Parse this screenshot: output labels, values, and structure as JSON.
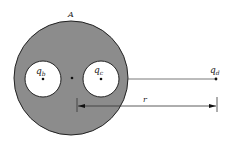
{
  "diagram": {
    "labels": {
      "sphere": "A",
      "charge_b": "q",
      "charge_b_sub": "b",
      "charge_c": "q",
      "charge_c_sub": "c",
      "charge_d": "q",
      "charge_d_sub": "d",
      "distance": "r"
    },
    "colors": {
      "conductor_fill": "#8c8c8c",
      "cavity_fill": "#ffffff",
      "stroke": "#222222"
    }
  }
}
